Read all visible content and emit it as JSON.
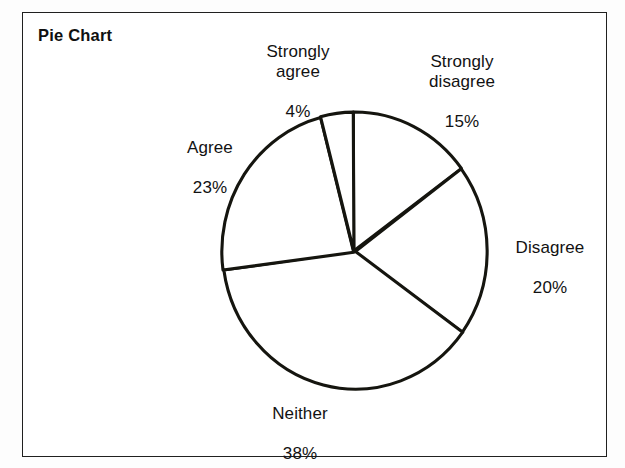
{
  "figure": {
    "title": "Pie Chart",
    "frame_color": "#20201f",
    "background_color": "#ffffff",
    "stroke_color": "#15150f"
  },
  "chart_data": {
    "type": "pie",
    "title": "Pie Chart",
    "xlabel": "",
    "ylabel": "",
    "grid": false,
    "legend": "none",
    "labels_position": "outside",
    "start_angle_deg": 0,
    "direction": "clockwise",
    "categories": [
      "Strongly disagree",
      "Disagree",
      "Neither",
      "Agree",
      "Strongly agree"
    ],
    "values": [
      15,
      20,
      38,
      23,
      4
    ],
    "units": "percent",
    "slices": [
      {
        "label": "Strongly disagree",
        "value": 15,
        "value_text": "15%",
        "start_deg": 0.0,
        "end_deg": 54.0,
        "color": "#ffffff"
      },
      {
        "label": "Disagree",
        "value": 20,
        "value_text": "20%",
        "start_deg": 54.0,
        "end_deg": 126.0,
        "color": "#ffffff"
      },
      {
        "label": "Neither",
        "value": 38,
        "value_text": "38%",
        "start_deg": 126.0,
        "end_deg": 262.8,
        "color": "#ffffff"
      },
      {
        "label": "Agree",
        "value": 23,
        "value_text": "23%",
        "start_deg": 262.8,
        "end_deg": 345.6,
        "color": "#ffffff"
      },
      {
        "label": "Strongly agree",
        "value": 4,
        "value_text": "4%",
        "start_deg": 345.6,
        "end_deg": 360.0,
        "color": "#ffffff"
      }
    ],
    "total": 100
  },
  "labels": {
    "strongly_agree": {
      "name": "Strongly\nagree",
      "value": "4%"
    },
    "strongly_disagree": {
      "name": "Strongly\ndisagree",
      "value": "15%"
    },
    "agree": {
      "name": "Agree",
      "value": "23%"
    },
    "disagree": {
      "name": "Disagree",
      "value": "20%"
    },
    "neither": {
      "name": "Neither",
      "value": "38%"
    }
  }
}
